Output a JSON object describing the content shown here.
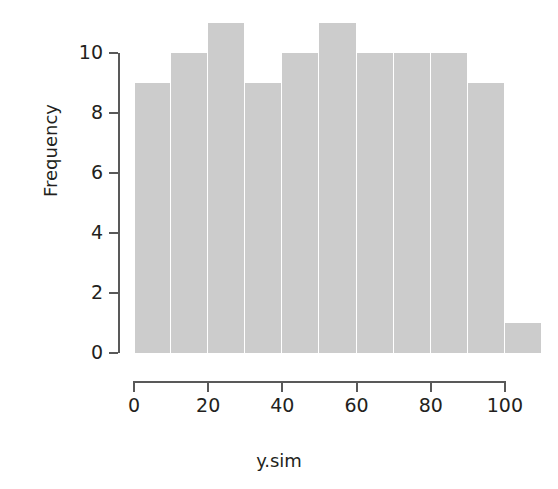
{
  "chart_data": {
    "type": "bar",
    "subtype": "histogram",
    "title": "",
    "xlabel": "y.sim",
    "ylabel": "Frequency",
    "xlim": [
      0,
      110
    ],
    "ylim": [
      0,
      11
    ],
    "grid": false,
    "legend": null,
    "bin_width": 10,
    "bin_edges": [
      0,
      10,
      20,
      30,
      40,
      50,
      60,
      70,
      80,
      90,
      100,
      110
    ],
    "categories": [
      "0-10",
      "10-20",
      "20-30",
      "30-40",
      "40-50",
      "50-60",
      "60-70",
      "70-80",
      "80-90",
      "90-100",
      "100-110"
    ],
    "values": [
      9,
      10,
      11,
      9,
      10,
      11,
      10,
      10,
      10,
      9,
      1
    ],
    "bars": [
      {
        "label": "0-10",
        "x0": 0,
        "x1": 10,
        "value": 9
      },
      {
        "label": "10-20",
        "x0": 10,
        "x1": 20,
        "value": 10
      },
      {
        "label": "20-30",
        "x0": 20,
        "x1": 30,
        "value": 11
      },
      {
        "label": "30-40",
        "x0": 30,
        "x1": 40,
        "value": 9
      },
      {
        "label": "40-50",
        "x0": 40,
        "x1": 50,
        "value": 10
      },
      {
        "label": "50-60",
        "x0": 50,
        "x1": 60,
        "value": 11
      },
      {
        "label": "60-70",
        "x0": 60,
        "x1": 70,
        "value": 10
      },
      {
        "label": "70-80",
        "x0": 70,
        "x1": 80,
        "value": 10
      },
      {
        "label": "80-90",
        "x0": 80,
        "x1": 90,
        "value": 10
      },
      {
        "label": "90-100",
        "x0": 90,
        "x1": 100,
        "value": 9
      },
      {
        "label": "100-110",
        "x0": 100,
        "x1": 110,
        "value": 1
      }
    ],
    "y_ticks": [
      0,
      2,
      4,
      6,
      8,
      10
    ],
    "y_tick_labels": [
      "0",
      "2",
      "4",
      "6",
      "8",
      "10"
    ],
    "x_ticks": [
      0,
      20,
      40,
      60,
      80,
      100
    ],
    "x_tick_labels": [
      "0",
      "20",
      "40",
      "60",
      "80",
      "100"
    ],
    "colors": {
      "bar_fill": "#cccccc",
      "bar_border": "#ffffff",
      "axis": "#595959",
      "text": "#231f20",
      "background": "#ffffff"
    }
  }
}
